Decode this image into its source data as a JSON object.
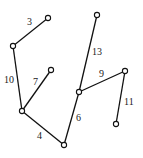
{
  "diagram": {
    "type": "weighted-tree",
    "nodes": [
      {
        "id": "a",
        "x": 48,
        "y": 18
      },
      {
        "id": "b",
        "x": 13,
        "y": 46
      },
      {
        "id": "c",
        "x": 51,
        "y": 70
      },
      {
        "id": "d",
        "x": 22,
        "y": 111
      },
      {
        "id": "e",
        "x": 64,
        "y": 145
      },
      {
        "id": "f",
        "x": 79,
        "y": 92
      },
      {
        "id": "g",
        "x": 97,
        "y": 15
      },
      {
        "id": "h",
        "x": 125,
        "y": 71
      },
      {
        "id": "i",
        "x": 116,
        "y": 124
      }
    ],
    "edges": [
      {
        "from": "a",
        "to": "b",
        "weight": "3",
        "lx": 27,
        "ly": 25
      },
      {
        "from": "b",
        "to": "d",
        "weight": "10",
        "lx": 4,
        "ly": 83
      },
      {
        "from": "c",
        "to": "d",
        "weight": "7",
        "lx": 33,
        "ly": 85
      },
      {
        "from": "d",
        "to": "e",
        "weight": "4",
        "lx": 37,
        "ly": 139
      },
      {
        "from": "e",
        "to": "f",
        "weight": "6",
        "lx": 76,
        "ly": 121
      },
      {
        "from": "f",
        "to": "g",
        "weight": "13",
        "lx": 92,
        "ly": 55
      },
      {
        "from": "f",
        "to": "h",
        "weight": "9",
        "lx": 99,
        "ly": 77
      },
      {
        "from": "h",
        "to": "i",
        "weight": "11",
        "lx": 124,
        "ly": 105
      }
    ]
  }
}
